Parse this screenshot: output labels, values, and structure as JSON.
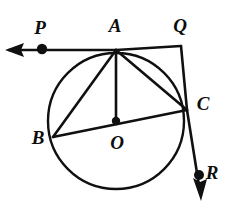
{
  "figure": {
    "kind": "geometry-diagram",
    "width": 230,
    "height": 218,
    "background_color": "#ffffff",
    "stroke_color": "#101010",
    "labels": [
      {
        "id": "P",
        "text": "P",
        "x": 40,
        "y": 27
      },
      {
        "id": "A",
        "text": "A",
        "x": 115,
        "y": 25
      },
      {
        "id": "Q",
        "text": "Q",
        "x": 180,
        "y": 25
      },
      {
        "id": "C",
        "text": "C",
        "x": 203,
        "y": 103
      },
      {
        "id": "B",
        "text": "B",
        "x": 38,
        "y": 137
      },
      {
        "id": "O",
        "text": "O",
        "x": 117,
        "y": 142
      },
      {
        "id": "R",
        "text": "R",
        "x": 212,
        "y": 172
      }
    ],
    "circle": {
      "cx": 116,
      "cy": 121,
      "r": 68
    },
    "points": [
      {
        "id": "A",
        "x": 116,
        "y": 50,
        "dot": false
      },
      {
        "id": "B",
        "x": 53,
        "y": 137,
        "dot": false
      },
      {
        "id": "C",
        "x": 187,
        "y": 110,
        "dot": false
      },
      {
        "id": "O",
        "x": 116,
        "y": 121,
        "dot": true
      },
      {
        "id": "P",
        "x": 42,
        "y": 49,
        "dot": true
      },
      {
        "id": "Q",
        "x": 181,
        "y": 46,
        "dot": false
      },
      {
        "id": "R",
        "x": 199,
        "y": 175,
        "dot": true
      }
    ],
    "segments": [
      {
        "id": "tangent-PA",
        "from": "P-arrow-tip",
        "to": "A",
        "x1": 9,
        "y1": 50,
        "x2": 116,
        "y2": 50
      },
      {
        "id": "tangent-AQ",
        "from": "A",
        "to": "Q",
        "x1": 116,
        "y1": 50,
        "x2": 181,
        "y2": 46
      },
      {
        "id": "secant-QC",
        "from": "Q",
        "to": "C",
        "x1": 181,
        "y1": 46,
        "x2": 187,
        "y2": 110
      },
      {
        "id": "secant-CR",
        "from": "C",
        "to": "R",
        "x1": 187,
        "y1": 110,
        "x2": 200,
        "y2": 192
      },
      {
        "id": "chord-AB",
        "from": "A",
        "to": "B",
        "x1": 116,
        "y1": 50,
        "x2": 53,
        "y2": 137
      },
      {
        "id": "radius-AO",
        "from": "A",
        "to": "O",
        "x1": 116,
        "y1": 50,
        "x2": 116,
        "y2": 121
      },
      {
        "id": "chord-AC",
        "from": "A",
        "to": "C",
        "x1": 116,
        "y1": 50,
        "x2": 187,
        "y2": 110
      },
      {
        "id": "diameter-BC",
        "from": "B",
        "to": "C",
        "x1": 53,
        "y1": 137,
        "x2": 187,
        "y2": 110
      }
    ],
    "arrows": [
      {
        "id": "arrow-P",
        "direction": "left",
        "tip_x": 5,
        "tip_y": 50
      },
      {
        "id": "arrow-R",
        "direction": "down",
        "tip_x": 201,
        "tip_y": 200
      }
    ]
  }
}
